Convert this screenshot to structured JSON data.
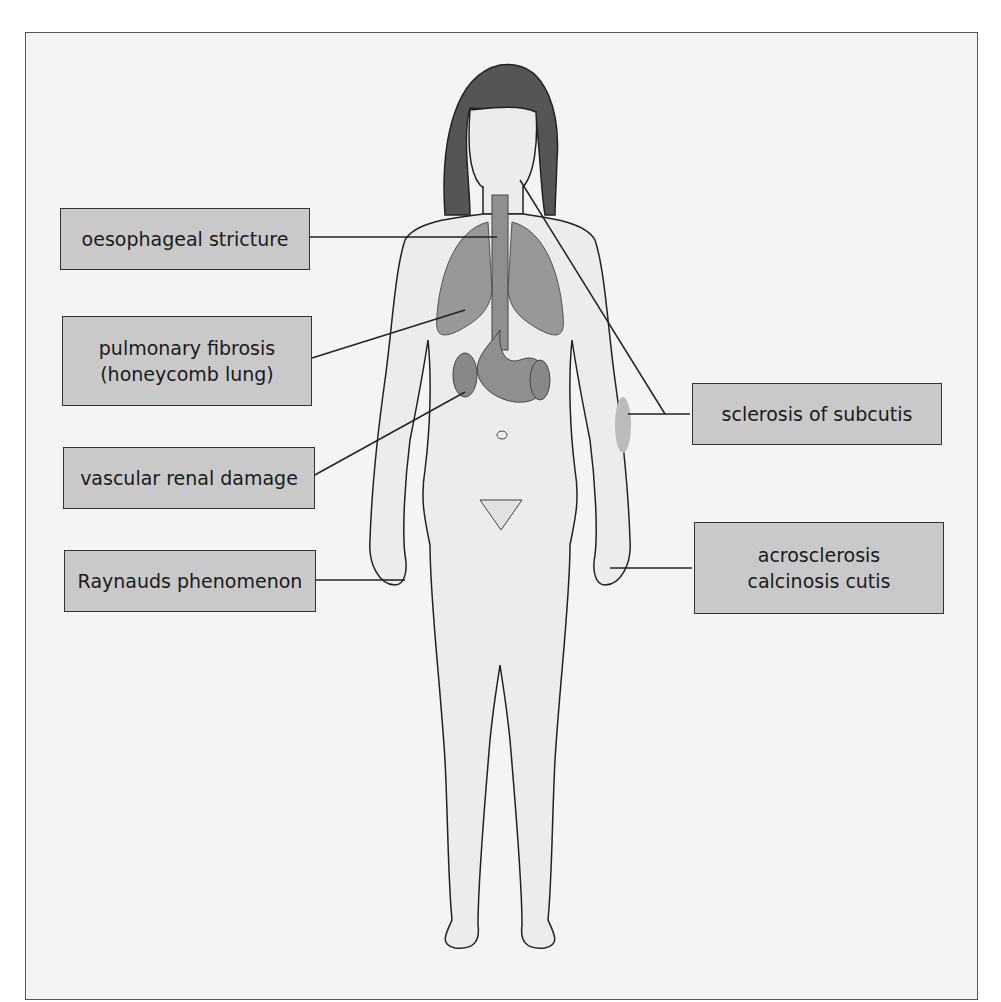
{
  "diagram": {
    "colors": {
      "background": "#f4f4f2",
      "label_fill": "#c9c9c9",
      "label_border": "#333333",
      "organ_fill": "#8f8f8f",
      "hair_fill": "#555555",
      "skin_fill": "#ececec",
      "line": "#222222"
    },
    "labels": [
      {
        "id": "oesophageal-stricture",
        "lines": [
          "oesophageal stricture"
        ],
        "side": "left",
        "target": "oesophagus"
      },
      {
        "id": "pulmonary-fibrosis",
        "lines": [
          "pulmonary fibrosis",
          "(honeycomb lung)"
        ],
        "side": "left",
        "target": "right lung"
      },
      {
        "id": "vascular-renal-damage",
        "lines": [
          "vascular renal damage"
        ],
        "side": "left",
        "target": "kidney"
      },
      {
        "id": "raynauds-phenomenon",
        "lines": [
          "Raynauds phenomenon"
        ],
        "side": "left",
        "target": "right hand"
      },
      {
        "id": "sclerosis-of-subcutis",
        "lines": [
          "sclerosis of subcutis"
        ],
        "side": "right",
        "target": "face and left forearm"
      },
      {
        "id": "acrosclerosis-calcinosis",
        "lines": [
          "acrosclerosis",
          "calcinosis cutis"
        ],
        "side": "right",
        "target": "left hand"
      }
    ]
  }
}
